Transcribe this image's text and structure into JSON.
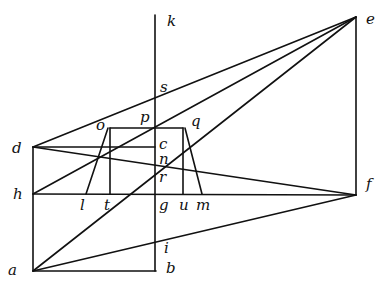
{
  "diagram": {
    "labels": {
      "k": "k",
      "e": "e",
      "s": "s",
      "p": "p",
      "o": "o",
      "q": "q",
      "d": "d",
      "c": "c",
      "n": "n",
      "h": "h",
      "r": "r",
      "f": "f",
      "l": "l",
      "t": "t",
      "g": "g",
      "u": "u",
      "m": "m",
      "i": "i",
      "a": "a",
      "b": "b"
    }
  }
}
